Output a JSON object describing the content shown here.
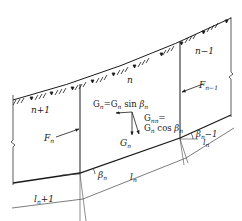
{
  "diagram": {
    "colors": {
      "line": "#1a1a1a",
      "thin": "#444444",
      "background": "#ffffff"
    },
    "slices": [
      {
        "label": "n+1"
      },
      {
        "label": "n"
      },
      {
        "label": "n−1"
      }
    ],
    "forces": {
      "F_n": "F",
      "F_n_sub": "n",
      "F_n1": "F",
      "F_n1_sub": "n−1",
      "G_n": "G",
      "G_n_sub": "n"
    },
    "equations": {
      "tangential_lhs": "G",
      "tangential_lhs_sub": "n",
      "tangential_rhs": "=G",
      "tangential_rhs_sub": "n",
      "tangential_fn": " sin ",
      "tangential_beta": "β",
      "tangential_beta_sub": "n",
      "normal_lhs": "G",
      "normal_lhs_sub": "nn",
      "normal_eq": "=",
      "normal_rhs": "G",
      "normal_rhs_sub": "n",
      "normal_fn": " cos ",
      "normal_beta": "β",
      "normal_beta_sub": "n"
    },
    "angles": {
      "beta_n": "β",
      "beta_n_sub": "n",
      "beta_n1": "β",
      "beta_n1_sub": "n",
      "beta_n1_suffix": "−1"
    },
    "lengths": {
      "l_n": "l",
      "l_n_sub": "n",
      "l_n1": "l",
      "l_n1_sub": "n",
      "l_n1_suffix": "+1",
      "l_nm1": "l",
      "l_nm1_sub": "n"
    }
  }
}
